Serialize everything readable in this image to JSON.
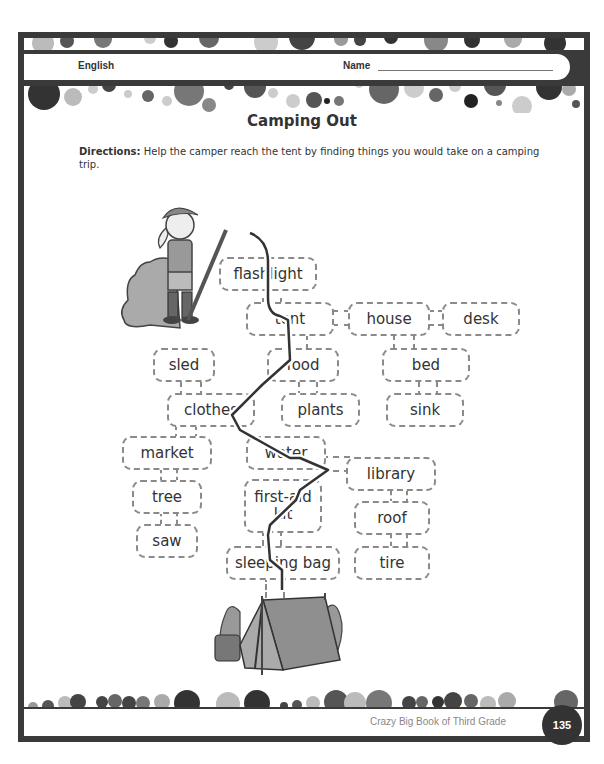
{
  "header": {
    "subject": "English",
    "name_label": "Name"
  },
  "worksheet": {
    "title": "Camping Out",
    "directions_label": "Directions:",
    "directions_text": " Help the camper reach the tent by finding things you would take on a camping trip."
  },
  "maze": {
    "start_icon": "camper-girl-illustration",
    "end_icon": "tent-illustration",
    "boxes": [
      {
        "id": "flashlight",
        "label": "flashlight"
      },
      {
        "id": "tent",
        "label": "tent"
      },
      {
        "id": "house",
        "label": "house"
      },
      {
        "id": "desk",
        "label": "desk"
      },
      {
        "id": "sled",
        "label": "sled"
      },
      {
        "id": "food",
        "label": "food"
      },
      {
        "id": "bed",
        "label": "bed"
      },
      {
        "id": "clothes",
        "label": "clothes"
      },
      {
        "id": "plants",
        "label": "plants"
      },
      {
        "id": "sink",
        "label": "sink"
      },
      {
        "id": "market",
        "label": "market"
      },
      {
        "id": "water",
        "label": "water"
      },
      {
        "id": "library",
        "label": "library"
      },
      {
        "id": "tree",
        "label": "tree"
      },
      {
        "id": "first_aid_kit",
        "label": "first-aid kit"
      },
      {
        "id": "roof",
        "label": "roof"
      },
      {
        "id": "saw",
        "label": "saw"
      },
      {
        "id": "sleeping_bag",
        "label": "sleeping bag"
      },
      {
        "id": "tire",
        "label": "tire"
      }
    ],
    "solution_path": [
      "flashlight",
      "tent",
      "food",
      "clothes",
      "water",
      "first-aid kit",
      "sleeping bag"
    ]
  },
  "footer": {
    "book_title": "Crazy Big Book of Third Grade",
    "page_number": "135"
  }
}
